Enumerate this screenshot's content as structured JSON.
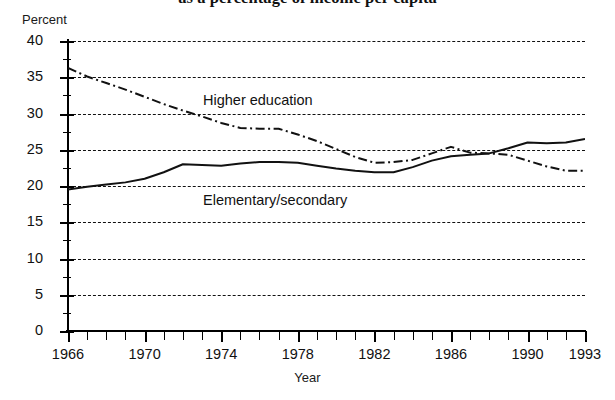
{
  "chart_data": {
    "type": "line",
    "title": "as a percentage of income per capita",
    "xlabel": "Year",
    "ylabel": "Percent",
    "ylim": [
      0,
      40
    ],
    "xlim": [
      1966,
      1993
    ],
    "ytick_step": 5,
    "yticks": [
      "40",
      "35",
      "30",
      "25",
      "20",
      "15",
      "10",
      "5",
      "0"
    ],
    "xticks": [
      "1966",
      "1970",
      "1974",
      "1978",
      "1982",
      "1986",
      "1990",
      "1993"
    ],
    "xtick_years": [
      1966,
      1970,
      1974,
      1978,
      1982,
      1986,
      1990,
      1993
    ],
    "grid": "horizontal-dashed",
    "legend": "inline-annotations",
    "x": [
      1966,
      1967,
      1968,
      1969,
      1970,
      1971,
      1972,
      1973,
      1974,
      1975,
      1976,
      1977,
      1978,
      1979,
      1980,
      1981,
      1982,
      1983,
      1984,
      1985,
      1986,
      1987,
      1988,
      1989,
      1990,
      1991,
      1992,
      1993
    ],
    "series": [
      {
        "name": "Higher education",
        "style": "dash-dot",
        "values": [
          36.3,
          35.1,
          34.2,
          33.3,
          32.3,
          31.3,
          30.4,
          29.6,
          28.7,
          28.0,
          27.9,
          27.9,
          27.1,
          26.2,
          25.1,
          24.0,
          23.2,
          23.3,
          23.6,
          24.5,
          25.4,
          24.6,
          24.5,
          24.3,
          23.5,
          22.7,
          22.1,
          22.1
        ]
      },
      {
        "name": "Elementary/secondary",
        "style": "solid",
        "values": [
          19.5,
          19.9,
          20.2,
          20.5,
          21.0,
          21.9,
          23.0,
          22.9,
          22.8,
          23.1,
          23.3,
          23.3,
          23.2,
          22.8,
          22.4,
          22.1,
          21.9,
          21.9,
          22.6,
          23.5,
          24.1,
          24.3,
          24.5,
          25.2,
          26.0,
          25.9,
          26.0,
          26.5
        ]
      }
    ],
    "annotations": [
      {
        "text": "Higher education",
        "series": "Higher education"
      },
      {
        "text": "Elementary/secondary",
        "series": "Elementary/secondary"
      }
    ]
  }
}
